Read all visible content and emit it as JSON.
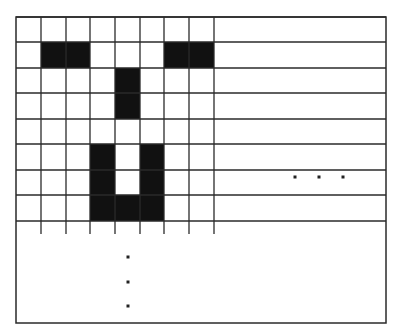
{
  "diagram": {
    "colors": {
      "background": "#ffffff",
      "line": "#2a2a2a",
      "fill": "#111111",
      "dot": "#222222"
    },
    "frame": {
      "x": 16,
      "y": 17,
      "width": 370,
      "height": 306
    },
    "grid": {
      "cols": 8,
      "rows": 8,
      "col_x": [
        16,
        41,
        66,
        90,
        115,
        140,
        164,
        189,
        214
      ],
      "row_y": [
        17,
        42,
        68,
        93,
        119,
        144,
        170,
        195,
        221
      ],
      "tick_bottom_y": 234,
      "right_extension_x": 386
    },
    "filled_cells": [
      {
        "row": 1,
        "col": 1
      },
      {
        "row": 1,
        "col": 2
      },
      {
        "row": 1,
        "col": 6
      },
      {
        "row": 1,
        "col": 7
      },
      {
        "row": 2,
        "col": 4
      },
      {
        "row": 3,
        "col": 4
      },
      {
        "row": 5,
        "col": 3
      },
      {
        "row": 5,
        "col": 5
      },
      {
        "row": 6,
        "col": 3
      },
      {
        "row": 6,
        "col": 5
      },
      {
        "row": 7,
        "col": 3
      },
      {
        "row": 7,
        "col": 4
      },
      {
        "row": 7,
        "col": 5
      }
    ],
    "ellipsis_vertical": {
      "label": "⋮",
      "points": [
        [
          128,
          257
        ],
        [
          128,
          282
        ],
        [
          128,
          306
        ]
      ]
    },
    "ellipsis_horizontal": {
      "label": "…",
      "points": [
        [
          295,
          177
        ],
        [
          319,
          177
        ],
        [
          343,
          177
        ]
      ]
    }
  }
}
